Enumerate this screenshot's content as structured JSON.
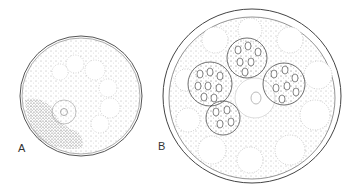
{
  "figure": {
    "panels": [
      {
        "label": "A",
        "description": "cell with dotted cytoplasm, vacuoles and nucleus"
      },
      {
        "label": "B",
        "description": "cell with central nucleus and three granular spherical bodies"
      }
    ],
    "colors": {
      "ink": "#444444",
      "background": "#ffffff"
    }
  }
}
